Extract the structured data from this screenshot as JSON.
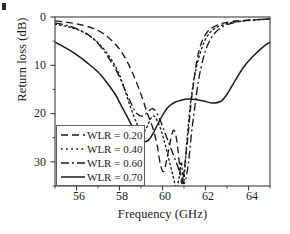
{
  "figure": {
    "background": "#ffffff",
    "ink": "#1a1a1a",
    "corner_mark": "page-edge-artifact"
  },
  "chart_data": {
    "type": "line",
    "title": "",
    "xlabel": "Frequency (GHz)",
    "ylabel": "Return loss (dB)",
    "xlim": [
      55,
      65
    ],
    "ylim": [
      0,
      35
    ],
    "y_inverted": true,
    "grid": false,
    "legend_position": "lower-left-inside",
    "xticks": [
      56,
      58,
      60,
      62,
      64
    ],
    "xtick_labels": [
      "56",
      "58",
      "60",
      "62",
      "64"
    ],
    "yticks": [
      0,
      10,
      20,
      30
    ],
    "ytick_labels": [
      "0",
      "10",
      "20",
      "30"
    ],
    "x_minor_ticks": [
      55,
      57,
      59,
      61,
      63,
      65
    ],
    "y_minor_ticks": [
      5,
      15,
      25,
      35
    ],
    "series": [
      {
        "name": "WLR = 0.20",
        "label": "WLR = 0.20",
        "style": "dashed",
        "dasharray": "7,4",
        "color": "#1a1a1a",
        "x": [
          55.0,
          55.6,
          56.2,
          56.8,
          57.3,
          57.8,
          58.2,
          58.6,
          59.0,
          59.3,
          59.55,
          59.75,
          59.9,
          60.05,
          60.2,
          60.35,
          60.5,
          60.62,
          60.72,
          60.8,
          60.9,
          61.0,
          61.1,
          61.2,
          61.3,
          61.45,
          61.6,
          61.8,
          62.1,
          62.5,
          63.0,
          63.8,
          65.0
        ],
        "y": [
          0.8,
          1.1,
          1.6,
          2.4,
          3.6,
          5.6,
          8.0,
          11.5,
          16.0,
          20.0,
          23.0,
          26.5,
          30.5,
          32.0,
          29.5,
          26.0,
          23.5,
          24.5,
          27.5,
          31.0,
          34.5,
          32.0,
          28.0,
          24.0,
          19.0,
          13.5,
          9.0,
          5.5,
          3.0,
          1.8,
          1.1,
          0.7,
          0.4
        ]
      },
      {
        "name": "WLR = 0.40",
        "label": "WLR = 0.40",
        "style": "dotted",
        "dasharray": "1.6,3",
        "color": "#1a1a1a",
        "x": [
          55.0,
          55.6,
          56.2,
          56.7,
          57.1,
          57.5,
          57.9,
          58.2,
          58.5,
          58.8,
          59.05,
          59.25,
          59.4,
          59.55,
          59.7,
          59.9,
          60.1,
          60.3,
          60.5,
          60.65,
          60.78,
          60.88,
          60.97,
          61.05,
          61.15,
          61.3,
          61.5,
          61.75,
          62.05,
          62.4,
          62.9,
          63.6,
          65.0
        ],
        "y": [
          1.5,
          2.0,
          2.9,
          4.2,
          5.8,
          8.0,
          11.0,
          14.5,
          18.5,
          22.0,
          24.0,
          23.0,
          21.5,
          20.5,
          21.0,
          23.0,
          26.0,
          29.5,
          33.0,
          35.5,
          33.0,
          30.0,
          34.5,
          31.0,
          25.0,
          18.0,
          12.0,
          7.5,
          4.2,
          2.5,
          1.5,
          0.9,
          0.4
        ]
      },
      {
        "name": "WLR = 0.60",
        "label": "WLR = 0.60",
        "style": "dashdot",
        "dasharray": "8,3,2,3",
        "color": "#1a1a1a",
        "x": [
          55.0,
          55.6,
          56.2,
          56.7,
          57.1,
          57.5,
          57.9,
          58.2,
          58.5,
          58.8,
          59.1,
          59.35,
          59.55,
          59.75,
          59.95,
          60.2,
          60.5,
          60.8,
          61.0,
          61.15,
          61.25,
          61.35,
          61.45,
          61.55,
          61.7,
          61.9,
          62.1,
          62.4,
          62.8,
          63.3,
          64.0,
          65.0
        ],
        "y": [
          1.2,
          1.8,
          2.8,
          4.2,
          6.0,
          8.5,
          11.5,
          14.5,
          17.5,
          20.0,
          20.5,
          19.5,
          19.0,
          20.0,
          22.0,
          25.0,
          28.5,
          32.0,
          34.5,
          32.0,
          28.5,
          24.0,
          20.5,
          17.0,
          12.5,
          8.5,
          5.8,
          3.5,
          2.0,
          1.2,
          0.7,
          0.4
        ]
      },
      {
        "name": "WLR = 0.70",
        "label": "WLR = 0.70",
        "style": "solid",
        "dasharray": "none",
        "color": "#1a1a1a",
        "x": [
          55.0,
          55.5,
          56.0,
          56.5,
          57.0,
          57.4,
          57.8,
          58.1,
          58.4,
          58.7,
          58.95,
          59.15,
          59.35,
          59.55,
          59.8,
          60.05,
          60.3,
          60.6,
          60.9,
          61.2,
          61.5,
          61.9,
          62.3,
          62.7,
          63.0,
          63.4,
          63.8,
          64.2,
          64.6,
          65.0
        ],
        "y": [
          5.2,
          6.4,
          7.8,
          9.5,
          11.4,
          13.5,
          16.0,
          18.5,
          21.0,
          23.6,
          25.2,
          25.8,
          25.5,
          24.2,
          22.0,
          20.0,
          18.5,
          17.6,
          17.2,
          17.0,
          17.1,
          17.4,
          17.8,
          17.5,
          16.0,
          13.0,
          10.2,
          8.2,
          6.5,
          5.2
        ]
      }
    ]
  },
  "legend": {
    "entries": [
      {
        "label": "WLR = 0.20",
        "style": "dashed"
      },
      {
        "label": "WLR = 0.40",
        "style": "dotted"
      },
      {
        "label": "WLR = 0.60",
        "style": "dashdot"
      },
      {
        "label": "WLR = 0.70",
        "style": "solid"
      }
    ]
  }
}
